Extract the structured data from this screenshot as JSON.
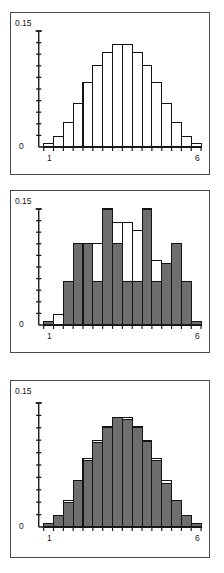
{
  "figure": {
    "title": "",
    "panel_count": 3,
    "colors": {
      "bar_fill_gray": "#6e6e6e",
      "bar_fill_white": "#ffffff",
      "bar_outline": "#141414",
      "axis": "#1a1a1a",
      "frame": "#4a4a4a",
      "background": "#ffffff"
    }
  },
  "axes": {
    "y_top_label": "0.15",
    "y_bottom_label": "0",
    "x_left_label": "1",
    "x_right_label": "6",
    "y_min": 0,
    "y_max": 0.15,
    "y_tick_count": 10,
    "x_min": 1,
    "x_max": 6,
    "x_tick_count": 16
  },
  "chart_data": [
    {
      "type": "bar",
      "name": "panel-1-theoretical-distribution",
      "title": "",
      "xlabel": "",
      "ylabel": "",
      "xlim": [
        1,
        6
      ],
      "ylim": [
        0,
        0.15
      ],
      "grid": false,
      "legend": "none",
      "style": "white-filled outlined bars",
      "categories": [
        "1",
        "2",
        "3",
        "4",
        "5",
        "6",
        "7",
        "8",
        "9",
        "10",
        "11",
        "12",
        "13",
        "14",
        "15",
        "16"
      ],
      "tick_labels": {
        "first": "1",
        "last": "6"
      },
      "series": [
        {
          "name": "theoretical",
          "fill": "#ffffff",
          "values": [
            0.004,
            0.014,
            0.032,
            0.056,
            0.083,
            0.105,
            0.122,
            0.133,
            0.133,
            0.122,
            0.105,
            0.083,
            0.056,
            0.032,
            0.014,
            0.004
          ]
        }
      ]
    },
    {
      "type": "bar",
      "name": "panel-2-small-sample-vs-theoretical",
      "title": "",
      "xlabel": "",
      "ylabel": "",
      "xlim": [
        1,
        6
      ],
      "ylim": [
        0,
        0.15
      ],
      "grid": false,
      "legend": "none",
      "style": "gray sample bars overlaid on white theoretical outline",
      "categories": [
        "1",
        "2",
        "3",
        "4",
        "5",
        "6",
        "7",
        "8",
        "9",
        "10",
        "11",
        "12",
        "13",
        "14",
        "15",
        "16"
      ],
      "tick_labels": {
        "first": "1",
        "last": "6"
      },
      "series": [
        {
          "name": "theoretical",
          "fill": "#ffffff",
          "values": [
            0.004,
            0.014,
            0.032,
            0.056,
            0.083,
            0.105,
            0.122,
            0.133,
            0.133,
            0.122,
            0.105,
            0.083,
            0.056,
            0.032,
            0.014,
            0.004
          ]
        },
        {
          "name": "sample",
          "fill": "#6e6e6e",
          "values": [
            0.004,
            0.0,
            0.056,
            0.105,
            0.105,
            0.056,
            0.15,
            0.105,
            0.056,
            0.056,
            0.15,
            0.056,
            0.08,
            0.105,
            0.056,
            0.004
          ]
        }
      ]
    },
    {
      "type": "bar",
      "name": "panel-3-large-sample-vs-theoretical",
      "title": "",
      "xlabel": "",
      "ylabel": "",
      "xlim": [
        1,
        6
      ],
      "ylim": [
        0,
        0.15
      ],
      "grid": false,
      "legend": "none",
      "style": "gray sample bars closely matching theoretical outline",
      "categories": [
        "1",
        "2",
        "3",
        "4",
        "5",
        "6",
        "7",
        "8",
        "9",
        "10",
        "11",
        "12",
        "13",
        "14",
        "15",
        "16"
      ],
      "tick_labels": {
        "first": "1",
        "last": "6"
      },
      "series": [
        {
          "name": "theoretical",
          "fill": "#ffffff",
          "values": [
            0.004,
            0.014,
            0.032,
            0.056,
            0.083,
            0.105,
            0.122,
            0.133,
            0.133,
            0.122,
            0.105,
            0.083,
            0.056,
            0.032,
            0.014,
            0.004
          ]
        },
        {
          "name": "sample",
          "fill": "#6e6e6e",
          "values": [
            0.004,
            0.014,
            0.03,
            0.056,
            0.08,
            0.102,
            0.12,
            0.133,
            0.13,
            0.12,
            0.103,
            0.08,
            0.053,
            0.032,
            0.014,
            0.004
          ]
        }
      ]
    }
  ]
}
